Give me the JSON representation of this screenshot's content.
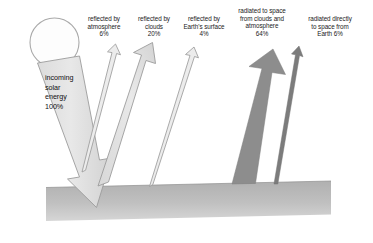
{
  "diagram": {
    "background_color": "#ffffff",
    "ground_color": "#b9b9b9",
    "sun": {
      "name": "sun",
      "fill": "#fdfdfd",
      "stroke": "#a8a8a8"
    },
    "flows": [
      {
        "id": "incoming",
        "label": "incoming\nsolar\nenergy\n100%",
        "percent": "100%",
        "direction": "downward",
        "color": "#e2e2e2",
        "stroke": "#9a9a9a",
        "style": "thick-outlined"
      },
      {
        "id": "reflected-atmosphere",
        "label": "reflected by\natmosphere\n6%",
        "percent": "6%",
        "direction": "upward",
        "color": "#e8e8e8",
        "stroke": "#9a9a9a",
        "style": "thin-outlined"
      },
      {
        "id": "reflected-clouds",
        "label": "reflected by\nclouds\n20%",
        "percent": "20%",
        "direction": "upward",
        "color": "#e4e4e4",
        "stroke": "#9a9a9a",
        "style": "medium-outlined"
      },
      {
        "id": "reflected-earth-surface",
        "label": "reflected by\nEarth's surface\n4%",
        "percent": "4%",
        "direction": "upward",
        "color": "#e8e8e8",
        "stroke": "#9a9a9a",
        "style": "thin-outlined"
      },
      {
        "id": "radiated-clouds-atmosphere",
        "label": "radiated to space\nfrom clouds and\natmosphere\n64%",
        "percent": "64%",
        "direction": "upward",
        "color": "#8c8c8c",
        "stroke": "#8c8c8c",
        "style": "thick-filled"
      },
      {
        "id": "radiated-directly-earth",
        "label": "radiated directly\nto space from\nEarth 6%",
        "percent": "6%",
        "direction": "upward",
        "color": "#7a7a7a",
        "stroke": "#7a7a7a",
        "style": "thin-filled"
      }
    ]
  }
}
